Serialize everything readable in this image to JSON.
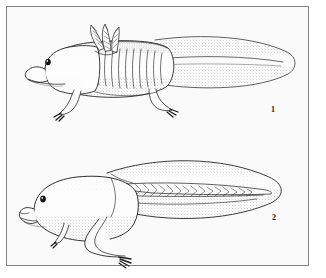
{
  "plate": {
    "background_color": "#ffffff",
    "paper_color": "#fafafa",
    "frame_color": "#8a8a8a",
    "ink_color": "#1a1a1a",
    "caption_1": "1",
    "caption_2": "2"
  },
  "figures": [
    {
      "number": "1",
      "subject": "salamander-larva-with-external-gills",
      "features": [
        "head",
        "eye",
        "mouth",
        "external-gill-plumes",
        "costal-grooves",
        "forelimb",
        "hindlimb",
        "tail-fin",
        "stipple-shading"
      ]
    },
    {
      "number": "2",
      "subject": "tadpole-with-developing-hind-limbs",
      "features": [
        "head",
        "eye",
        "mouth",
        "body",
        "forelimb",
        "hindlimb",
        "tail-fin",
        "myotome-chevrons",
        "stipple-shading"
      ]
    }
  ]
}
